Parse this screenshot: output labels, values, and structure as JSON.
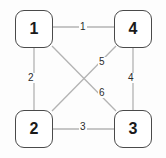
{
  "diagram": {
    "type": "undirected-graph",
    "background_color": "#fdfdfd",
    "node_border_color": "#4a4a4a",
    "edge_color": "#b3b3b3",
    "label_color": "#2b2b2b",
    "nodes": [
      {
        "id": "1",
        "label": "1",
        "position": "top-left"
      },
      {
        "id": "2",
        "label": "2",
        "position": "bottom-left"
      },
      {
        "id": "3",
        "label": "3",
        "position": "bottom-right"
      },
      {
        "id": "4",
        "label": "4",
        "position": "top-right"
      }
    ],
    "edges": [
      {
        "label": "1",
        "from": "1",
        "to": "4",
        "shape": "horizontal-top"
      },
      {
        "label": "2",
        "from": "1",
        "to": "2",
        "shape": "vertical-left"
      },
      {
        "label": "3",
        "from": "2",
        "to": "3",
        "shape": "horizontal-bottom"
      },
      {
        "label": "4",
        "from": "4",
        "to": "3",
        "shape": "vertical-right"
      },
      {
        "label": "5",
        "from": "4",
        "to": "2",
        "shape": "diagonal"
      },
      {
        "label": "6",
        "from": "1",
        "to": "3",
        "shape": "diagonal"
      }
    ]
  }
}
